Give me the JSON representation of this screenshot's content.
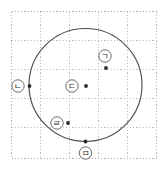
{
  "figure": {
    "background_color": "#ffffff",
    "grid": {
      "color": "#bdbdbd",
      "border_color": "#b0b0b0",
      "style": "dotted",
      "left": 11,
      "top": 11,
      "right": 156,
      "bottom": 158,
      "cell_size": 29,
      "x_lines": [
        11,
        40,
        69,
        98,
        127,
        156
      ],
      "y_lines": [
        11,
        40,
        69,
        98,
        127,
        158
      ]
    },
    "circle": {
      "color": "#4d4d4d",
      "cx": 85.5,
      "cy": 85,
      "r": 56.5,
      "stroke_width": 1.15
    },
    "points": [
      {
        "id": "point-giyeok",
        "label": "ㄱ",
        "dot_x": 106,
        "dot_y": 68,
        "label_x": 105,
        "label_y": 56,
        "on_circle": false,
        "dot_color": "#2b2b2b"
      },
      {
        "id": "point-nieun",
        "label": "ㄴ",
        "dot_x": 29.5,
        "dot_y": 86,
        "label_x": 18,
        "label_y": 86,
        "on_circle": true,
        "dot_color": "#2b2b2b"
      },
      {
        "id": "point-digeut",
        "label": "ㄷ",
        "dot_x": 86,
        "dot_y": 86,
        "label_x": 72,
        "label_y": 86,
        "on_circle": false,
        "dot_color": "#2b2b2b"
      },
      {
        "id": "point-rieul",
        "label": "ㄹ",
        "dot_x": 68,
        "dot_y": 123,
        "label_x": 57,
        "label_y": 123,
        "on_circle": false,
        "dot_color": "#2b2b2b"
      },
      {
        "id": "point-mieum",
        "label": "ㅁ",
        "dot_x": 85.5,
        "dot_y": 141.5,
        "label_x": 85.5,
        "label_y": 153,
        "on_circle": true,
        "dot_color": "#2b2b2b"
      }
    ],
    "label_ring": {
      "radius": 6.2,
      "fill": "#ffffff",
      "stroke": "#5a5a5a"
    },
    "dot_radius": 1.9
  }
}
